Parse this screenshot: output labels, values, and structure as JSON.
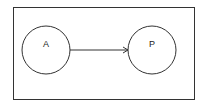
{
  "diagram": {
    "nodes": [
      {
        "id": "A",
        "label": "A",
        "cx": 46,
        "cy": 50,
        "r": 24
      },
      {
        "id": "P",
        "label": "P",
        "cx": 152,
        "cy": 50,
        "r": 24
      }
    ],
    "edges": [
      {
        "from": "A",
        "to": "P",
        "directed": true
      }
    ],
    "colors": {
      "stroke": "#333333",
      "background": "#ffffff"
    }
  }
}
